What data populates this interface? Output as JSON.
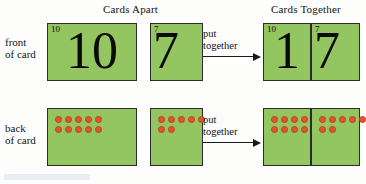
{
  "figure": {
    "type": "diagram",
    "topic": "place-value cards showing 10 and 7 combined to make 17",
    "card_color": "#93c560",
    "dot_color": "#e2552c",
    "border_color": "#2b2b2b"
  },
  "headings": {
    "apart": "Cards Apart",
    "together": "Cards Together"
  },
  "row_labels": {
    "front_line1": "front",
    "front_line2": "of card",
    "back_line1": "back",
    "back_line2": "of card"
  },
  "connector": {
    "top_line1": "put",
    "top_line2": "together",
    "bottom_line1": "put",
    "bottom_line2": "together",
    "arrow_icon": "arrow-right-icon"
  },
  "cards": {
    "front_apart_ten": {
      "corner": "10",
      "numeral": "10"
    },
    "front_apart_seven": {
      "corner": "7",
      "numeral": "7"
    },
    "front_together_ten": {
      "corner": "10",
      "numeral": "1"
    },
    "front_together_seven": {
      "corner": "7",
      "numeral": "7"
    }
  },
  "dot_groups": {
    "back_apart_ten": {
      "count": 10,
      "rows": [
        5,
        5
      ]
    },
    "back_apart_seven": {
      "count": 7,
      "rows": [
        5,
        2
      ]
    },
    "back_together_ten": {
      "count": 10,
      "rows": [
        5,
        5
      ]
    },
    "back_together_seven": {
      "count": 7,
      "rows": [
        5,
        2
      ]
    }
  }
}
